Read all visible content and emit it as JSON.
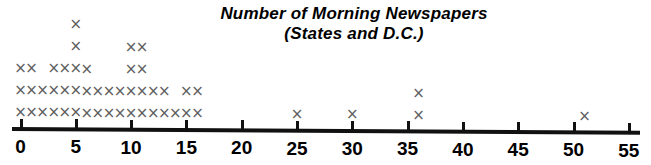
{
  "chart_data": {
    "type": "scatter",
    "plot_style": "dot-plot-x-marks",
    "title": "Number of Morning Newspapers",
    "subtitle": "(States and D.C.)",
    "xlabel": "",
    "ylabel": "",
    "xlim": [
      0,
      55
    ],
    "tick_step": 5,
    "tick_labels": [
      "0",
      "5",
      "10",
      "15",
      "20",
      "25",
      "30",
      "35",
      "40",
      "45",
      "50",
      "55"
    ],
    "tick_values": [
      0,
      5,
      10,
      15,
      20,
      25,
      30,
      35,
      40,
      45,
      50,
      55
    ],
    "grid": false,
    "legend": null,
    "marker": "x",
    "marker_color": "#5e5e5e",
    "axis_color": "#111111",
    "categories": [
      0,
      1,
      2,
      3,
      4,
      5,
      6,
      7,
      8,
      9,
      10,
      11,
      12,
      13,
      14,
      15,
      16,
      25,
      30,
      36,
      51
    ],
    "values": [
      3,
      3,
      2,
      3,
      3,
      5,
      3,
      2,
      2,
      2,
      4,
      4,
      2,
      2,
      1,
      2,
      2,
      1,
      1,
      2,
      1
    ],
    "total_observations": 51,
    "ylim": [
      0,
      5
    ]
  },
  "chart": {
    "title_line1": "Number of Morning Newspapers",
    "title_line2": "(States and D.C.)"
  }
}
